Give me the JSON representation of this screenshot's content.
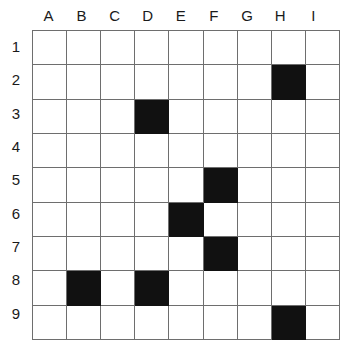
{
  "figure": {
    "name": "grid-puzzle",
    "columns": [
      "A",
      "B",
      "C",
      "D",
      "E",
      "F",
      "G",
      "H",
      "I"
    ],
    "rows": [
      "1",
      "2",
      "3",
      "4",
      "5",
      "6",
      "7",
      "8",
      "9"
    ],
    "colors": {
      "filled": "#111111",
      "empty": "#ffffff",
      "gridline": "#6e6e6e",
      "label": "#1a1a1a"
    },
    "filled_cells": [
      "H2",
      "D3",
      "F5",
      "E6",
      "F7",
      "B8",
      "D8",
      "H9"
    ],
    "cells": [
      [
        "",
        "",
        "",
        "",
        "",
        "",
        "",
        "",
        ""
      ],
      [
        "",
        "",
        "",
        "",
        "",
        "",
        "",
        "filled",
        ""
      ],
      [
        "",
        "",
        "",
        "filled",
        "",
        "",
        "",
        "",
        ""
      ],
      [
        "",
        "",
        "",
        "",
        "",
        "",
        "",
        "",
        ""
      ],
      [
        "",
        "",
        "",
        "",
        "",
        "filled",
        "",
        "",
        ""
      ],
      [
        "",
        "",
        "",
        "",
        "filled",
        "",
        "",
        "",
        ""
      ],
      [
        "",
        "",
        "",
        "",
        "",
        "filled",
        "",
        "",
        ""
      ],
      [
        "",
        "filled",
        "",
        "filled",
        "",
        "",
        "",
        "",
        ""
      ],
      [
        "",
        "",
        "",
        "",
        "",
        "",
        "",
        "filled",
        ""
      ]
    ]
  },
  "chart_data": {
    "type": "heatmap",
    "title": "",
    "xlabel": "",
    "ylabel": "",
    "categories": [
      "A",
      "B",
      "C",
      "D",
      "E",
      "F",
      "G",
      "H",
      "I"
    ],
    "rows": [
      "1",
      "2",
      "3",
      "4",
      "5",
      "6",
      "7",
      "8",
      "9"
    ],
    "grid": true,
    "legend": "none",
    "values": [
      [
        0,
        0,
        0,
        0,
        0,
        0,
        0,
        0,
        0
      ],
      [
        0,
        0,
        0,
        0,
        0,
        0,
        0,
        1,
        0
      ],
      [
        0,
        0,
        0,
        1,
        0,
        0,
        0,
        0,
        0
      ],
      [
        0,
        0,
        0,
        0,
        0,
        0,
        0,
        0,
        0
      ],
      [
        0,
        0,
        0,
        0,
        0,
        1,
        0,
        0,
        0
      ],
      [
        0,
        0,
        0,
        0,
        1,
        0,
        0,
        0,
        0
      ],
      [
        0,
        0,
        0,
        0,
        0,
        1,
        0,
        0,
        0
      ],
      [
        0,
        1,
        0,
        1,
        0,
        0,
        0,
        0,
        0
      ],
      [
        0,
        0,
        0,
        0,
        0,
        0,
        0,
        1,
        0
      ]
    ]
  }
}
